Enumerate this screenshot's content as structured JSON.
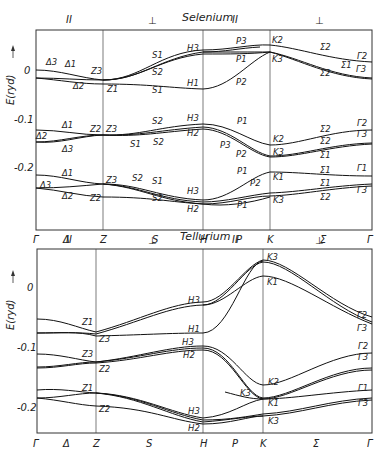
{
  "selenium": {
    "title": "Selenium",
    "polarization_labels": [
      "II",
      "⊥",
      "II",
      "⊥"
    ],
    "ylabel": "E(ryd)",
    "yticks": [
      "0",
      "-0.1",
      "-0.2"
    ],
    "xticks": [
      "Γ",
      "Δ",
      "Z",
      "S",
      "H",
      "P",
      "K",
      "Σ",
      "Γ"
    ],
    "band_labels": {
      "group1": [
        "Δ1",
        "Δ1",
        "Δ2",
        "Z3",
        "Z1",
        "S1",
        "S2",
        "S1",
        "H3",
        "H1",
        "P3",
        "P1",
        "P2",
        "K2",
        "K3",
        "Σ2",
        "Σ1",
        "Σ2",
        "Γ2",
        "Γ3"
      ],
      "group2": [
        "Δ1",
        "Δ2",
        "Δ3",
        "Z2",
        "Z3",
        "S2",
        "S1",
        "S2",
        "H3",
        "H2",
        "P1",
        "P3",
        "P2",
        "K2",
        "K1",
        "Σ2",
        "Σ2",
        "Σ1",
        "Γ2",
        "Γ3"
      ],
      "group3": [
        "Δ1",
        "Δ3",
        "Δ2",
        "Z3",
        "Z2",
        "S2",
        "S1",
        "S2",
        "H3",
        "H2",
        "P1",
        "P2",
        "P1",
        "K1",
        "K3",
        "Σ1",
        "Σ1",
        "Σ2",
        "Γ1",
        "Γ3"
      ]
    }
  },
  "tellurium": {
    "title": "Tellurium",
    "polarization_labels": [
      "II",
      "⊥",
      "II",
      "⊥"
    ],
    "ylabel": "E(ryd)",
    "yticks": [
      "0",
      "-0.1",
      "-0.2"
    ],
    "xticks": [
      "Γ",
      "Δ",
      "Z",
      "S",
      "H",
      "P",
      "K",
      "Σ",
      "Γ"
    ],
    "band_labels": {
      "group1": [
        "Z1",
        "Z3",
        "H3",
        "H1",
        "K3",
        "K1",
        "Γ2",
        "Γ3"
      ],
      "group2": [
        "Z3",
        "Z2",
        "H3",
        "H2",
        "K2",
        "K3",
        "Γ2",
        "Γ3",
        "Γ1"
      ],
      "group3": [
        "Z1",
        "Z2",
        "H3",
        "H2",
        "K1",
        "K3",
        "Γ1",
        "Γ3"
      ]
    }
  }
}
